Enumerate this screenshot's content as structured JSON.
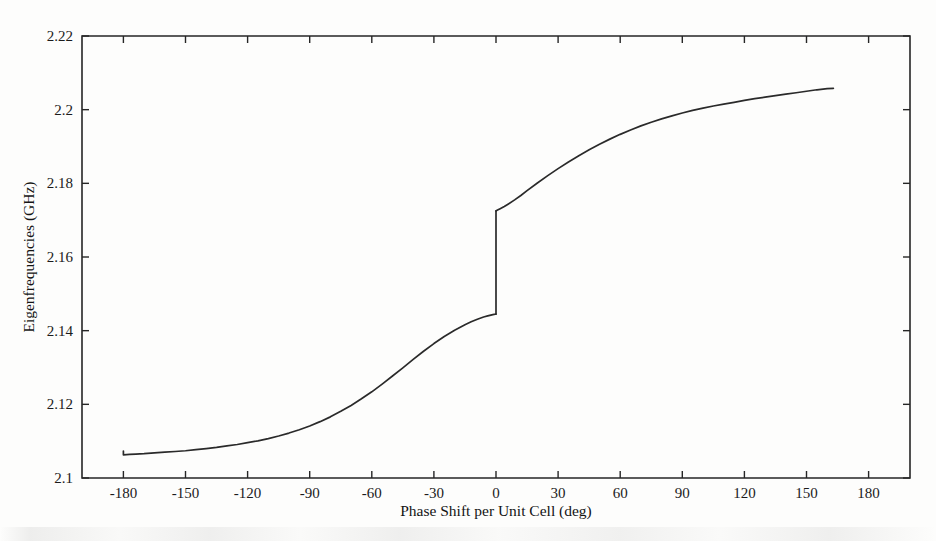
{
  "chart_data": {
    "type": "line",
    "title": "",
    "subtitle": "",
    "xlabel": "Phase Shift per Unit Cell (deg)",
    "ylabel": "Eigenfrequencies (GHz)",
    "xlim": [
      -200,
      200
    ],
    "ylim": [
      2.1,
      2.22
    ],
    "xticks": [
      -180,
      -150,
      -120,
      -90,
      -60,
      -30,
      0,
      30,
      60,
      90,
      120,
      150,
      180
    ],
    "xtick_labels": [
      "-180",
      "-150",
      "-120",
      "-90",
      "-60",
      "-30",
      "0",
      "30",
      "60",
      "90",
      "120",
      "150",
      "180"
    ],
    "yticks": [
      2.1,
      2.12,
      2.14,
      2.16,
      2.18,
      2.2,
      2.22
    ],
    "ytick_labels": [
      "2.1",
      "2.12",
      "2.14",
      "2.16",
      "2.18",
      "2.2",
      "2.22"
    ],
    "grid": false,
    "legend": null,
    "legend_position": "none",
    "line_color": "#2a2a2a",
    "series": [
      {
        "name": "branch-lower",
        "x": [
          -180,
          -180,
          -177,
          -174,
          -170,
          -165,
          -160,
          -155,
          -150,
          -145,
          -140,
          -135,
          -130,
          -125,
          -120,
          -115,
          -110,
          -105,
          -100,
          -95,
          -90,
          -85,
          -80,
          -75,
          -70,
          -65,
          -60,
          -55,
          -50,
          -45,
          -40,
          -35,
          -30,
          -25,
          -20,
          -15,
          -12,
          -9,
          -6,
          -4,
          -2,
          -1,
          -0.3,
          0
        ],
        "y": [
          2.1073,
          2.1063,
          2.1064,
          2.1065,
          2.1066,
          2.1068,
          2.107,
          2.1072,
          2.1074,
          2.1077,
          2.108,
          2.1083,
          2.1087,
          2.1091,
          2.1096,
          2.1101,
          2.1107,
          2.1114,
          2.1122,
          2.1131,
          2.1141,
          2.1153,
          2.1166,
          2.1181,
          2.1197,
          2.1215,
          2.1234,
          2.1255,
          2.1277,
          2.1299,
          2.1322,
          2.1344,
          2.1365,
          2.1384,
          2.1401,
          2.1416,
          2.1424,
          2.1431,
          2.1437,
          2.144,
          2.1443,
          2.1444,
          2.1445,
          2.1445
        ]
      },
      {
        "name": "branch-upper",
        "x": [
          0,
          0.3,
          1,
          2,
          4,
          6,
          9,
          12,
          15,
          20,
          25,
          30,
          35,
          40,
          45,
          50,
          55,
          60,
          65,
          70,
          75,
          80,
          85,
          90,
          95,
          100,
          105,
          110,
          115,
          120,
          125,
          130,
          135,
          140,
          145,
          150,
          155,
          160,
          163
        ],
        "y": [
          2.1725,
          2.1726,
          2.1728,
          2.1731,
          2.1737,
          2.1744,
          2.1755,
          2.1767,
          2.178,
          2.1801,
          2.1821,
          2.184,
          2.1858,
          2.1875,
          2.1891,
          2.1906,
          2.192,
          2.1933,
          2.1945,
          2.1956,
          2.1966,
          2.1975,
          2.1983,
          2.1991,
          2.1998,
          2.2004,
          2.201,
          2.2015,
          2.202,
          2.2025,
          2.203,
          2.2034,
          2.2038,
          2.2042,
          2.2046,
          2.205,
          2.2054,
          2.2057,
          2.2058
        ]
      },
      {
        "name": "jump-at-zero",
        "x": [
          0,
          0
        ],
        "y": [
          2.1445,
          2.1725
        ]
      }
    ],
    "annotations": [
      {
        "label": "discontinuity",
        "x": 0,
        "y_from": 2.1445,
        "y_to": 2.1725
      }
    ]
  },
  "figure": {
    "xlabel": "Phase Shift per Unit Cell (deg)",
    "ylabel": "Eigenfrequencies (GHz)"
  }
}
